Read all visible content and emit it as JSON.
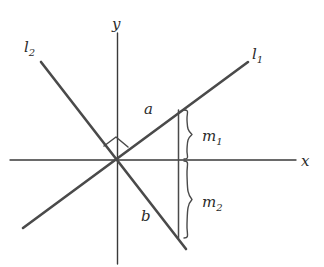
{
  "figure": {
    "background_color": "#ffffff",
    "stroke_color": "#4a4a4a",
    "axis_color": "#3a3a3a",
    "label_color": "#2b2b2b",
    "axes": {
      "x_label": "x",
      "y_label": "y",
      "origin_label": ""
    },
    "lines": [
      {
        "name": "l1",
        "label": "l",
        "label_sub": "1",
        "description": "line with positive slope rising to the upper right"
      },
      {
        "name": "l2",
        "label": "l",
        "label_sub": "2",
        "description": "line with negative slope falling to the lower right"
      }
    ],
    "points": [
      {
        "name": "a",
        "label": "a",
        "description": "point where line l1 crosses above the x-axis"
      },
      {
        "name": "b",
        "label": "b",
        "description": "point where line l2 crosses below the x-axis"
      }
    ],
    "measures": [
      {
        "name": "m1",
        "label": "m",
        "label_sub": "1",
        "description": "brace measuring the distance from point a down to the x-axis"
      },
      {
        "name": "m2",
        "label": "m",
        "label_sub": "2",
        "description": "brace measuring the distance from the x-axis down to point b"
      }
    ],
    "marks": [
      {
        "name": "right-angle",
        "symbol": "square",
        "description": "right angle mark between l1 and l2 at the origin"
      }
    ]
  }
}
